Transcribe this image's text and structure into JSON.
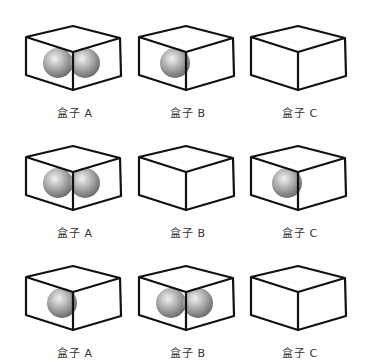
{
  "rows": [
    {
      "boxes": [
        {
          "label": "盒子 A",
          "balls": 2
        },
        {
          "label": "盒子 B",
          "balls": 1
        },
        {
          "label": "盒子 C",
          "balls": 0
        }
      ]
    },
    {
      "boxes": [
        {
          "label": "盒子 A",
          "balls": 2
        },
        {
          "label": "盒子 B",
          "balls": 0
        },
        {
          "label": "盒子 C",
          "balls": 1
        }
      ]
    },
    {
      "boxes": [
        {
          "label": "盒子 A",
          "balls": 1
        },
        {
          "label": "盒子 B",
          "balls": 2
        },
        {
          "label": "盒子 C",
          "balls": 0
        }
      ]
    }
  ],
  "colors": {
    "edge": "#111111",
    "ball_light": "#f2f2f2",
    "ball_dark": "#6e6e6e"
  }
}
